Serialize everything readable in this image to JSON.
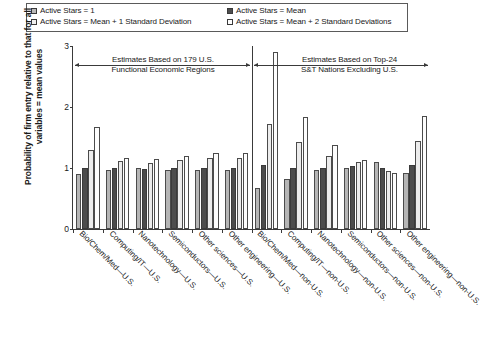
{
  "legend": {
    "entries": [
      {
        "label": "Active Stars = 1",
        "swatch": "s1"
      },
      {
        "label": "Active Stars = Mean",
        "swatch": "s2"
      },
      {
        "label": "Active Stars = Mean + 1 Standard Deviation",
        "swatch": "s3"
      },
      {
        "label": "Active Stars = Mean + 2 Standard Deviations",
        "swatch": "s4"
      }
    ]
  },
  "annotations": {
    "left_line1": "Estimates Based on 179 U.S.",
    "left_line2": "Functional Economic Regions",
    "right_line1": "Estimates Based on Top-24",
    "right_line2": "S&T Nations Excluding U.S."
  },
  "chart_data": {
    "type": "bar",
    "title": "",
    "xlabel": "",
    "ylabel": "Probability of firm entry relative to that for all variables = mean values",
    "ylim": [
      0,
      3
    ],
    "yticks": [
      "0",
      "1",
      "2",
      "3"
    ],
    "grid": false,
    "legend_position": "top",
    "categories": [
      "Bio/Chem/Med—U.S.",
      "Computing/IT—U.S.",
      "Nanotechnology—U.S.",
      "Semiconductors—U.S.",
      "Other sciences—U.S.",
      "Other engineering—U.S.",
      "Bio/Chem/Med—non-U.S.",
      "Computing/IT—non-U.S.",
      "Nanotechnology—non-U.S.",
      "Semiconductors—non-U.S.",
      "Other sciences—non-U.S.",
      "Other engineering—non-U.S."
    ],
    "series": [
      {
        "name": "Active Stars = 1",
        "swatch": "s1",
        "values": [
          0.91,
          0.97,
          1.0,
          0.96,
          0.97,
          0.97,
          0.68,
          0.82,
          0.96,
          1.0,
          1.1,
          0.92
        ]
      },
      {
        "name": "Active Stars = Mean",
        "swatch": "s2",
        "values": [
          1.0,
          1.0,
          0.98,
          1.0,
          1.0,
          1.0,
          1.05,
          1.0,
          1.0,
          1.03,
          1.0,
          1.05
        ]
      },
      {
        "name": "Active Stars = Mean + 1 Standard Deviation",
        "swatch": "s3",
        "values": [
          1.3,
          1.11,
          1.08,
          1.13,
          1.16,
          1.16,
          1.72,
          1.42,
          1.2,
          1.1,
          0.95,
          1.45
        ]
      },
      {
        "name": "Active Stars = Mean + 2 Standard Deviations",
        "swatch": "s4",
        "values": [
          1.67,
          1.17,
          1.15,
          1.2,
          1.25,
          1.24,
          2.9,
          1.83,
          1.37,
          1.13,
          0.92,
          1.85
        ]
      }
    ]
  }
}
